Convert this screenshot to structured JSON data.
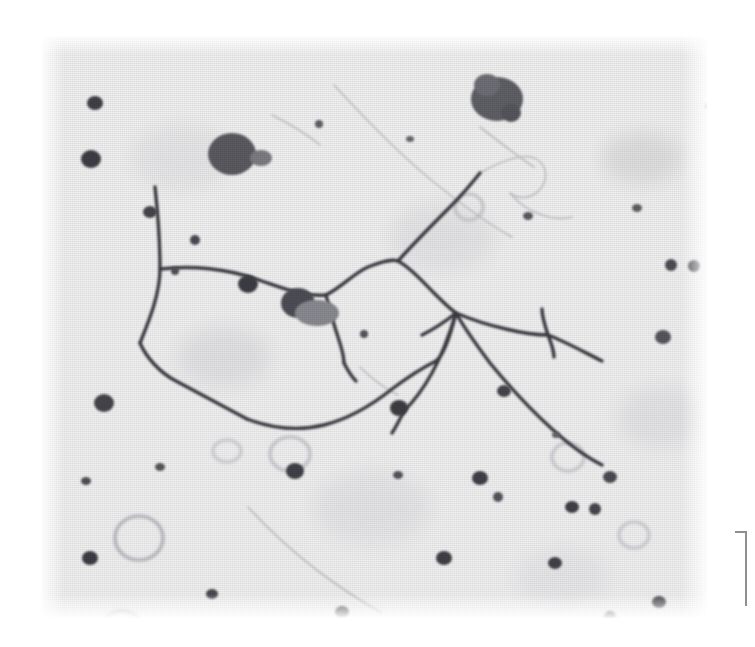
{
  "figure": {
    "kind": "photomicrograph",
    "caption": "",
    "plate": {
      "left": 42,
      "top": 37,
      "width": 665,
      "height": 581,
      "background_color": "#f2f2f2",
      "page_background_color": "#ffffff",
      "stain_color": "#3b3b42",
      "debris_color": "#55555c",
      "faint_color": "#b9b9bf",
      "rendering": "halftone-screened black-and-white print reproduction"
    },
    "panel_rule": {
      "color": "#8e8e93",
      "label": ""
    },
    "specimen": {
      "description": "silver-impregnated neurites / nerve fibre network on pale tissue background",
      "features": [
        "branched dark neurite arbor crossing the centre of the field",
        "dark round granules and debris particles scattered across the field",
        "pale ring-shaped vacuoles in the lower left quadrant",
        "faint diagonal scratch lines across upper and lower field"
      ]
    },
    "neurites": {
      "color": "#3b3b42",
      "paths": [
        "M 113,150 C 118,196 118,214 118,232 C 118,258 106,286 98,306",
        "M 98,306 C 104,320 118,336 134,344 C 160,358 186,372 205,382",
        "M 118,232 C 150,228 186,232 214,242 C 244,252 262,260 284,258",
        "M 284,258 C 300,250 312,236 326,230 C 342,224 350,222 356,224",
        "M 356,224 C 368,230 380,244 392,256 C 402,266 408,272 414,276",
        "M 356,224 C 372,206 392,186 408,170 C 420,158 430,146 438,136",
        "M 205,382 C 232,392 258,394 282,388 C 306,382 330,368 350,352 C 366,340 382,330 394,324",
        "M 394,324 C 402,318 408,300 414,276",
        "M 414,276 C 428,282 446,288 464,292 C 480,296 494,298 506,298",
        "M 506,298 C 522,304 540,314 560,324",
        "M 414,276 C 424,294 436,310 448,326 C 466,348 488,372 510,392 C 530,410 548,422 560,428",
        "M 506,298 C 502,286 500,278 500,272",
        "M 506,298 C 510,308 512,314 512,320",
        "M 414,276 C 408,296 400,318 390,336 C 380,354 370,366 362,374",
        "M 362,374 C 358,382 354,390 350,396",
        "M 414,276 C 404,284 392,292 380,298",
        "M 284,258 C 288,274 292,288 296,300 C 300,312 302,320 302,326",
        "M 302,326 C 306,334 310,340 314,344"
      ],
      "faint_paths": [
        "M 438,136 C 452,128 466,122 478,120 C 490,118 498,122 502,130 C 506,140 502,150 494,156 C 486,162 476,162 468,156",
        "M 468,156 C 476,166 488,174 500,178 C 512,182 522,182 530,180",
        "M 230,78 C 250,88 266,98 278,108",
        "M 292,48 C 320,78 352,112 388,142 C 420,168 448,188 470,200",
        "M 438,90 C 456,104 474,118 492,130",
        "M 206,470 C 226,492 250,514 276,534 C 300,552 322,566 340,576",
        "M 318,330 C 330,342 344,352 356,358"
      ]
    },
    "granules": [
      {
        "cx": 190,
        "cy": 117,
        "rx": 24,
        "ry": 21,
        "shade": "#5a5a61"
      },
      {
        "cx": 219,
        "cy": 121,
        "rx": 11,
        "ry": 8,
        "shade": "#7b7b82"
      },
      {
        "cx": 455,
        "cy": 62,
        "rx": 26,
        "ry": 22,
        "shade": "#5e5e66"
      },
      {
        "cx": 445,
        "cy": 48,
        "rx": 13,
        "ry": 11,
        "shade": "#6e6e76"
      },
      {
        "cx": 469,
        "cy": 76,
        "rx": 10,
        "ry": 9,
        "shade": "#55555c"
      },
      {
        "cx": 256,
        "cy": 266,
        "rx": 17,
        "ry": 15,
        "shade": "#4d4d54"
      },
      {
        "cx": 275,
        "cy": 276,
        "rx": 22,
        "ry": 13,
        "shade": "#8a8a91"
      },
      {
        "cx": 53,
        "cy": 66,
        "rx": 8,
        "ry": 7,
        "shade": "#3f3f46"
      },
      {
        "cx": 49,
        "cy": 122,
        "rx": 10,
        "ry": 9,
        "shade": "#3d3d44"
      },
      {
        "cx": 108,
        "cy": 175,
        "rx": 7,
        "ry": 6,
        "shade": "#44444b"
      },
      {
        "cx": 153,
        "cy": 203,
        "rx": 5,
        "ry": 5,
        "shade": "#4a4a51"
      },
      {
        "cx": 133,
        "cy": 234,
        "rx": 4,
        "ry": 4,
        "shade": "#505057"
      },
      {
        "cx": 206,
        "cy": 247,
        "rx": 10,
        "ry": 9,
        "shade": "#3e3e45"
      },
      {
        "cx": 62,
        "cy": 366,
        "rx": 10,
        "ry": 9,
        "shade": "#45454c"
      },
      {
        "cx": 253,
        "cy": 434,
        "rx": 9,
        "ry": 8,
        "shade": "#414148"
      },
      {
        "cx": 322,
        "cy": 297,
        "rx": 4,
        "ry": 4,
        "shade": "#55555c"
      },
      {
        "cx": 357,
        "cy": 371,
        "rx": 9,
        "ry": 8,
        "shade": "#3c3c43"
      },
      {
        "cx": 462,
        "cy": 354,
        "rx": 7,
        "ry": 6,
        "shade": "#45454c"
      },
      {
        "cx": 438,
        "cy": 441,
        "rx": 8,
        "ry": 7,
        "shade": "#414148"
      },
      {
        "cx": 456,
        "cy": 460,
        "rx": 5,
        "ry": 5,
        "shade": "#55555c"
      },
      {
        "cx": 530,
        "cy": 470,
        "rx": 7,
        "ry": 6,
        "shade": "#3f3f46"
      },
      {
        "cx": 553,
        "cy": 472,
        "rx": 6,
        "ry": 6,
        "shade": "#47474e"
      },
      {
        "cx": 568,
        "cy": 440,
        "rx": 7,
        "ry": 6,
        "shade": "#4b4b52"
      },
      {
        "cx": 513,
        "cy": 526,
        "rx": 7,
        "ry": 6,
        "shade": "#43434a"
      },
      {
        "cx": 621,
        "cy": 300,
        "rx": 8,
        "ry": 7,
        "shade": "#56565d"
      },
      {
        "cx": 629,
        "cy": 228,
        "rx": 6,
        "ry": 6,
        "shade": "#4e4e55"
      },
      {
        "cx": 652,
        "cy": 229,
        "rx": 6,
        "ry": 6,
        "shade": "#4e4e55"
      },
      {
        "cx": 686,
        "cy": 137,
        "rx": 7,
        "ry": 7,
        "shade": "#4a4a51"
      },
      {
        "cx": 700,
        "cy": 450,
        "rx": 7,
        "ry": 7,
        "shade": "#505057"
      },
      {
        "cx": 568,
        "cy": 580,
        "rx": 6,
        "ry": 6,
        "shade": "#48484f"
      },
      {
        "cx": 617,
        "cy": 565,
        "rx": 7,
        "ry": 6,
        "shade": "#45454c"
      },
      {
        "cx": 402,
        "cy": 521,
        "rx": 8,
        "ry": 7,
        "shade": "#3f3f46"
      },
      {
        "cx": 300,
        "cy": 575,
        "rx": 7,
        "ry": 6,
        "shade": "#42424a"
      },
      {
        "cx": 206,
        "cy": 593,
        "rx": 7,
        "ry": 6,
        "shade": "#43434b"
      },
      {
        "cx": 241,
        "cy": 599,
        "rx": 5,
        "ry": 5,
        "shade": "#4f4f56"
      },
      {
        "cx": 170,
        "cy": 557,
        "rx": 6,
        "ry": 5,
        "shade": "#4a4a51"
      },
      {
        "cx": 48,
        "cy": 521,
        "rx": 8,
        "ry": 7,
        "shade": "#3e3e45"
      },
      {
        "cx": 44,
        "cy": 444,
        "rx": 5,
        "ry": 4,
        "shade": "#505057"
      },
      {
        "cx": 118,
        "cy": 430,
        "rx": 5,
        "ry": 4,
        "shade": "#56565d"
      },
      {
        "cx": 356,
        "cy": 438,
        "rx": 5,
        "ry": 4,
        "shade": "#55555c"
      },
      {
        "cx": 486,
        "cy": 179,
        "rx": 5,
        "ry": 4,
        "shade": "#5a5a61"
      },
      {
        "cx": 595,
        "cy": 171,
        "rx": 5,
        "ry": 4,
        "shade": "#5e5e65"
      },
      {
        "cx": 668,
        "cy": 69,
        "rx": 5,
        "ry": 4,
        "shade": "#5c5c63"
      },
      {
        "cx": 277,
        "cy": 87,
        "rx": 4,
        "ry": 4,
        "shade": "#606067"
      },
      {
        "cx": 368,
        "cy": 102,
        "rx": 4,
        "ry": 3,
        "shade": "#66666d"
      },
      {
        "cx": 514,
        "cy": 398,
        "rx": 4,
        "ry": 3,
        "shade": "#63636a"
      }
    ],
    "vacuoles": [
      {
        "cx": 97,
        "cy": 501,
        "rx": 24,
        "ry": 22,
        "shade": "#b4b4bb"
      },
      {
        "cx": 80,
        "cy": 588,
        "rx": 18,
        "ry": 14,
        "shade": "#c2c2c8"
      },
      {
        "cx": 248,
        "cy": 417,
        "rx": 20,
        "ry": 17,
        "shade": "#c6c6cc"
      },
      {
        "cx": 185,
        "cy": 414,
        "rx": 14,
        "ry": 11,
        "shade": "#cfcfd4"
      },
      {
        "cx": 526,
        "cy": 420,
        "rx": 16,
        "ry": 14,
        "shade": "#cacad0"
      },
      {
        "cx": 592,
        "cy": 498,
        "rx": 15,
        "ry": 13,
        "shade": "#cdcdd2"
      },
      {
        "cx": 427,
        "cy": 170,
        "rx": 14,
        "ry": 13,
        "shade": "#c8c8ce"
      }
    ],
    "smudges": [
      {
        "cx": 600,
        "cy": 121,
        "rx": 40,
        "ry": 26,
        "shade": "#dededf"
      },
      {
        "cx": 182,
        "cy": 320,
        "rx": 46,
        "ry": 30,
        "shade": "#e2e2e4"
      },
      {
        "cx": 400,
        "cy": 200,
        "rx": 52,
        "ry": 34,
        "shade": "#e5e5e7"
      },
      {
        "cx": 330,
        "cy": 470,
        "rx": 58,
        "ry": 36,
        "shade": "#e6e6e8"
      },
      {
        "cx": 620,
        "cy": 380,
        "rx": 44,
        "ry": 30,
        "shade": "#e4e4e6"
      },
      {
        "cx": 140,
        "cy": 120,
        "rx": 50,
        "ry": 32,
        "shade": "#e7e7e9"
      },
      {
        "cx": 520,
        "cy": 540,
        "rx": 46,
        "ry": 28,
        "shade": "#e8e8ea"
      }
    ]
  }
}
